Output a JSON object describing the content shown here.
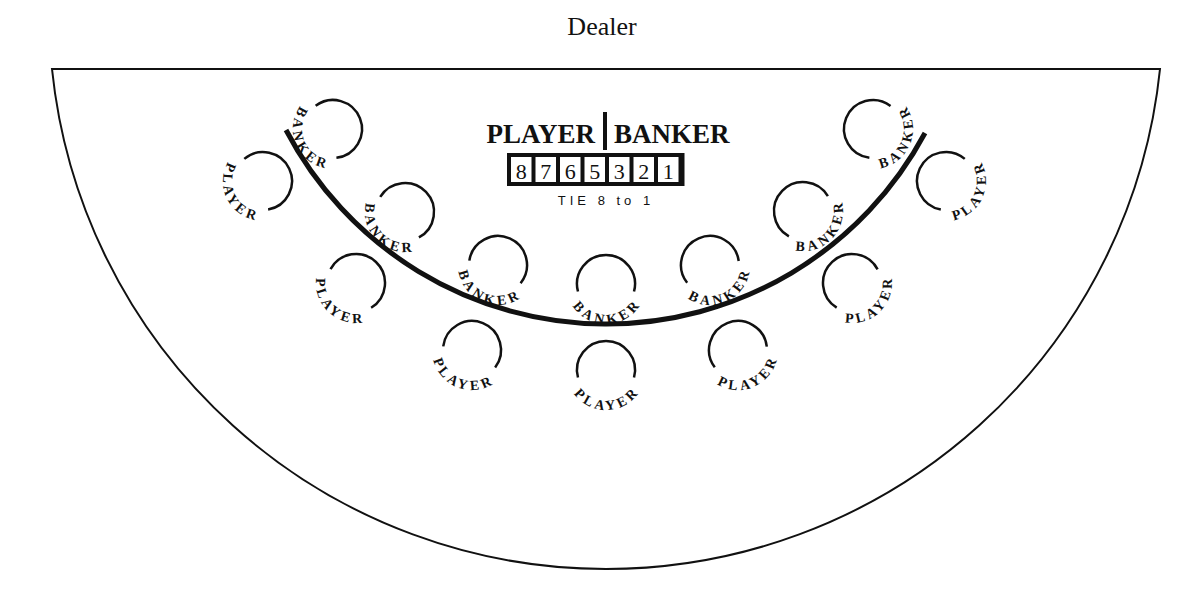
{
  "header": {
    "dealer_label": "Dealer"
  },
  "table": {
    "outline": {
      "left": 52,
      "right": 1160,
      "top": 69,
      "bottom": 569,
      "stroke": "#111111"
    },
    "inner_arc": {
      "start": [
        286,
        130
      ],
      "end": [
        925,
        133
      ],
      "bottom": 324
    }
  },
  "center_panel": {
    "left_label": "PLAYER",
    "right_label": "BANKER",
    "numbers": [
      "8",
      "7",
      "6",
      "5",
      "3",
      "2",
      "1"
    ],
    "tie_label": "TIE 8 to 1"
  },
  "banker_spots": [
    {
      "label": "BANKER",
      "cx": 333,
      "cy": 129
    },
    {
      "label": "BANKER",
      "cx": 405,
      "cy": 212
    },
    {
      "label": "BANKER",
      "cx": 498,
      "cy": 265
    },
    {
      "label": "BANKER",
      "cx": 606,
      "cy": 284
    },
    {
      "label": "BANKER",
      "cx": 710,
      "cy": 265
    },
    {
      "label": "BANKER",
      "cx": 803,
      "cy": 211
    },
    {
      "label": "BANKER",
      "cx": 873,
      "cy": 129
    }
  ],
  "player_spots": [
    {
      "label": "PLAYER",
      "cx": 263,
      "cy": 181
    },
    {
      "label": "PLAYER",
      "cx": 356,
      "cy": 283
    },
    {
      "label": "PLAYER",
      "cx": 472,
      "cy": 350
    },
    {
      "label": "PLAYER",
      "cx": 606,
      "cy": 370
    },
    {
      "label": "PLAYER",
      "cx": 738,
      "cy": 350
    },
    {
      "label": "PLAYER",
      "cx": 852,
      "cy": 283
    },
    {
      "label": "PLAYER",
      "cx": 946,
      "cy": 181
    }
  ]
}
